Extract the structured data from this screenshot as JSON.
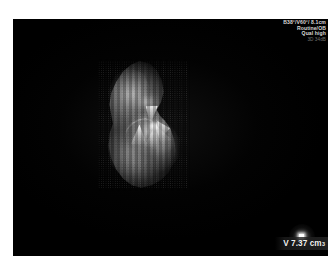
{
  "viewport": {
    "background_color": "#000000",
    "page_background_color": "#ffffff"
  },
  "acquisition_overlay": {
    "lines": [
      {
        "text": "B38°/V60°/ 8.1cm",
        "dim": false
      },
      {
        "text": "Routine/OB",
        "dim": false
      },
      {
        "text": "Qual high",
        "dim": false
      },
      {
        "text": "3D 34dB",
        "dim": true
      }
    ],
    "text_color": "#d9d9d9",
    "dim_text_color": "#6f6f6f"
  },
  "render": {
    "modality": "3d-surface-render",
    "colormap": "grayscale",
    "description": "3D surface rendered ultrasound volume"
  },
  "markers": {
    "light_source": {
      "name": "light-source-marker",
      "color": "#ffffff"
    }
  },
  "measurement": {
    "label": "V 7.37 cm",
    "superscript": "3",
    "value": 7.37,
    "unit": "cm³",
    "text_color": "#f2f2f2"
  }
}
